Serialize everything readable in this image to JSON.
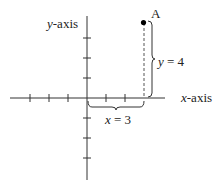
{
  "diagram": {
    "type": "coordinate-plane",
    "colors": {
      "axis": "#333333",
      "point": "#000000",
      "dashed": "#555555",
      "text": "#222222"
    },
    "axes": {
      "x_label_var": "x",
      "x_label_suffix": "-axis",
      "y_label_var": "y",
      "y_label_suffix": "-axis"
    },
    "point": {
      "label": "A",
      "x": 3,
      "y": 4
    },
    "annotations": {
      "x_brace_var": "x",
      "x_brace_rest": " = 3",
      "y_brace_var": "y",
      "y_brace_rest": " = 4"
    },
    "ticks": {
      "x_negative_count": 3,
      "x_positive_count": 3,
      "y_positive_count": 3,
      "y_negative_count": 3
    }
  }
}
